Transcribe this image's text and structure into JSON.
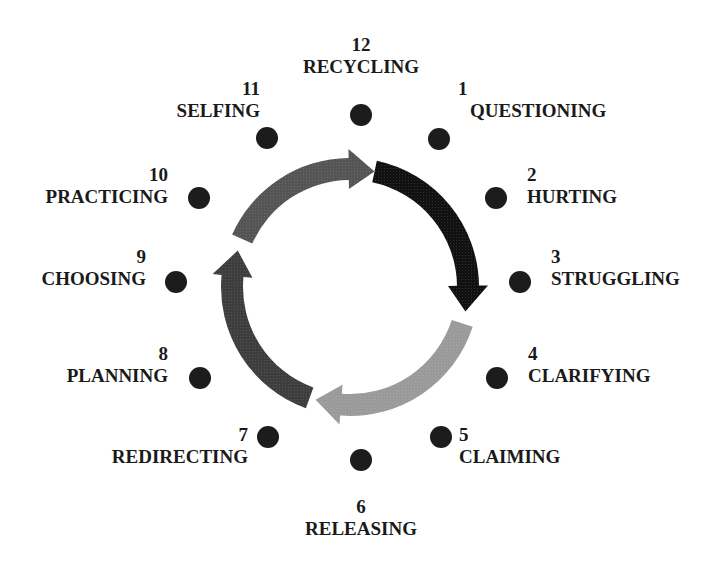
{
  "diagram": {
    "type": "cycle",
    "center": [
      350,
      287
    ],
    "colors": {
      "dot": "#1c1c1c",
      "text": "#1a1a1a",
      "arrow_dark": "#111111",
      "arrow_light": "#9a9a9a",
      "arrow_medium_dark": "#3e3e3e",
      "arrow_medium": "#555555"
    },
    "stages": [
      {
        "num": "12",
        "name": "RECYCLING"
      },
      {
        "num": "1",
        "name": "QUESTIONING"
      },
      {
        "num": "2",
        "name": "HURTING"
      },
      {
        "num": "3",
        "name": "STRUGGLING"
      },
      {
        "num": "4",
        "name": "CLARIFYING"
      },
      {
        "num": "5",
        "name": "CLAIMING"
      },
      {
        "num": "6",
        "name": "RELEASING"
      },
      {
        "num": "7",
        "name": "REDIRECTING"
      },
      {
        "num": "8",
        "name": "PLANNING"
      },
      {
        "num": "9",
        "name": "CHOOSING"
      },
      {
        "num": "10",
        "name": "PRACTICING"
      },
      {
        "num": "11",
        "name": "SELFING"
      }
    ],
    "arrows": [
      {
        "name": "arrow-stages-1-3",
        "from_deg": 12,
        "to_deg": 102,
        "shade": "dark"
      },
      {
        "name": "arrow-stages-4-6",
        "from_deg": 108,
        "to_deg": 197,
        "shade": "light"
      },
      {
        "name": "arrow-stages-7-9",
        "from_deg": 200,
        "to_deg": 288,
        "shade": "medium_dark"
      },
      {
        "name": "arrow-stages-10-12",
        "from_deg": 294,
        "to_deg": 372,
        "shade": "medium"
      }
    ]
  }
}
